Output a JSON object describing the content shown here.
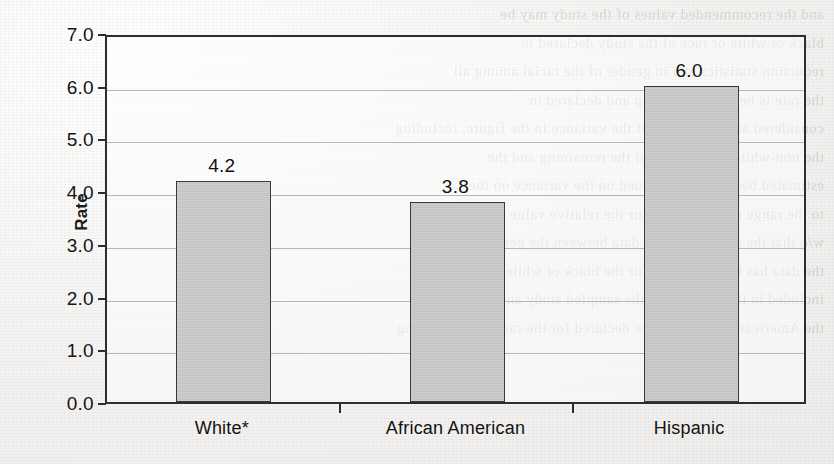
{
  "chart_data": {
    "type": "bar",
    "title": "",
    "subtitle": "",
    "xlabel": "",
    "ylabel": "Rate",
    "categories": [
      "White*",
      "African American",
      "Hispanic"
    ],
    "values": [
      4.2,
      3.8,
      6.0
    ],
    "value_labels": [
      "4.2",
      "3.8",
      "6.0"
    ],
    "ylim": [
      0.0,
      7.0
    ],
    "ytick_labels": [
      "7.0",
      "6.0",
      "5.0",
      "4.0",
      "3.0",
      "2.0",
      "1.0",
      "0.0"
    ],
    "ytick_values": [
      7.0,
      6.0,
      5.0,
      4.0,
      3.0,
      2.0,
      1.0,
      0.0
    ],
    "ytick_step": 1.0,
    "grid": true,
    "grid_axis": "y",
    "legend": false,
    "legend_position": "none",
    "bar_fill_color": "#c3c3c3",
    "bar_edge_color": "#3a3a3a",
    "axis_color": "#2e2e2e",
    "gridline_color": "#b9b7b3",
    "text_color": "#121212",
    "background_color": "#f3f2f0",
    "plot_background_color": "#ffffff",
    "annotations": [
      "*"
    ]
  },
  "scan": {
    "ghost_lines": [
      "and the recommended values of the study may be",
      "black or white or race of the study declared in",
      "reduction statistics and in gender of the racial among all",
      "the rate is between the group and declared in",
      "considered at the sampled of the variance in the figure, including",
      "the non-white populations of the remaining and the",
      "estimated based on a continued on the variance on the",
      "to the range of the selected or the relative value the",
      "w/o that the standard of the data between the percent",
      "the data has been reported for the black or white in the report",
      "included in the reported of the sampled study and the",
      "the American of the variance declared for the racial study among"
    ]
  }
}
